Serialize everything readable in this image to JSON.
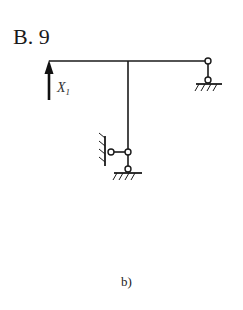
{
  "figure": {
    "title": "B. 9",
    "caption": "b)",
    "force_label": "X",
    "force_label_subscript": "1",
    "stroke_color": "#1a1a1a"
  },
  "structure": {
    "beam": {
      "from": [
        49,
        61
      ],
      "to": [
        208,
        61
      ]
    },
    "column": {
      "from": [
        128,
        61
      ],
      "to": [
        128,
        152
      ]
    },
    "supports": [
      {
        "type": "roller-link",
        "position": "right end of beam",
        "top_hinge": [
          208,
          61
        ],
        "bottom_hinge": [
          208,
          80
        ]
      },
      {
        "type": "horizontal-link",
        "position": "column base left",
        "hinge": [
          111,
          152
        ],
        "wall_x": 104
      },
      {
        "type": "vertical-link",
        "position": "column base",
        "hinge": [
          128,
          169
        ]
      }
    ],
    "redundant_force": {
      "label": "X1",
      "direction": "up",
      "at": [
        49,
        61
      ]
    }
  }
}
